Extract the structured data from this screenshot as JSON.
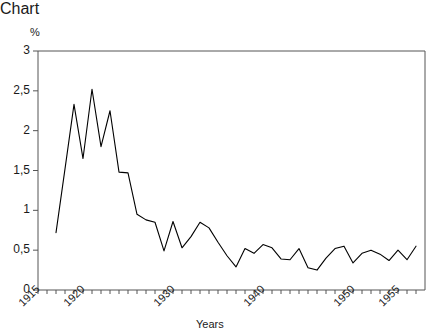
{
  "chart_data": {
    "type": "line",
    "title": "",
    "subtitle": "",
    "xlabel": "Years",
    "ylabel": "%",
    "unit_label": "%",
    "xlim": [
      1915,
      1958
    ],
    "ylim": [
      0,
      3
    ],
    "grid": false,
    "legend": false,
    "legend_position": "none",
    "line_color": "#000000",
    "background_color": "#ffffff",
    "axis_color": "#555555",
    "x_tick_interval": 1,
    "x_label_interval": 5,
    "y_tick_values": [
      0,
      0.5,
      1,
      1.5,
      2,
      2.5,
      3
    ],
    "y_tick_labels": [
      "0",
      "0,5",
      "1",
      "1,5",
      "2",
      "2,5",
      "3"
    ],
    "x_tick_values": [
      1915,
      1916,
      1917,
      1918,
      1919,
      1920,
      1921,
      1922,
      1923,
      1924,
      1925,
      1926,
      1927,
      1928,
      1929,
      1930,
      1931,
      1932,
      1933,
      1934,
      1935,
      1936,
      1937,
      1938,
      1939,
      1940,
      1941,
      1942,
      1943,
      1944,
      1945,
      1946,
      1947,
      1948,
      1949,
      1950,
      1951,
      1952,
      1953,
      1954,
      1955,
      1956,
      1957
    ],
    "x_labelled_ticks": [
      {
        "value": 1915,
        "label": "1915"
      },
      {
        "value": 1920,
        "label": "1920"
      },
      {
        "value": 1930,
        "label": "1930"
      },
      {
        "value": 1940,
        "label": "1940"
      },
      {
        "value": 1950,
        "label": "1950"
      },
      {
        "value": 1955,
        "label": "1955"
      }
    ],
    "series": [
      {
        "name": "",
        "x": [
          1917,
          1918,
          1919,
          1920,
          1921,
          1922,
          1923,
          1924,
          1925,
          1926,
          1927,
          1928,
          1929,
          1930,
          1931,
          1932,
          1933,
          1934,
          1935,
          1936,
          1937,
          1938,
          1939,
          1940,
          1941,
          1942,
          1943,
          1944,
          1945,
          1946,
          1947,
          1948,
          1949,
          1950,
          1951,
          1952,
          1953,
          1954,
          1955,
          1956,
          1957
        ],
        "values": [
          0.72,
          1.52,
          2.33,
          1.65,
          2.52,
          1.8,
          2.25,
          1.48,
          1.47,
          0.95,
          0.88,
          0.85,
          0.49,
          0.86,
          0.53,
          0.67,
          0.85,
          0.78,
          0.6,
          0.43,
          0.29,
          0.52,
          0.46,
          0.57,
          0.53,
          0.39,
          0.38,
          0.52,
          0.28,
          0.25,
          0.4,
          0.52,
          0.55,
          0.34,
          0.46,
          0.5,
          0.45,
          0.37,
          0.5,
          0.38,
          0.55
        ]
      }
    ]
  },
  "axes": {
    "unit": "%",
    "x_title": "Years"
  }
}
